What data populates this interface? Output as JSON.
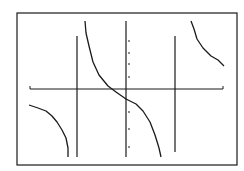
{
  "chart_data": {
    "type": "line",
    "title": "",
    "xlabel": "",
    "ylabel": "",
    "grid": false,
    "legend": null,
    "frame": {
      "x0": 17,
      "y0": 13,
      "x1": 237,
      "y1": 165
    },
    "axes": {
      "x_axis": {
        "y": 89,
        "x_start": 30,
        "x_end": 223
      },
      "y_axis": {
        "x": 126,
        "y_start": 21,
        "y_end": 157
      },
      "y_ticks_pixel": [
        41,
        53,
        64,
        77,
        112,
        129,
        147
      ]
    },
    "asymptotes_pixel_x": [
      77,
      175
    ],
    "series": [
      {
        "name": "left branch",
        "points": [
          [
            29,
            105
          ],
          [
            38,
            108
          ],
          [
            46,
            111
          ],
          [
            52,
            116
          ],
          [
            57,
            122
          ],
          [
            62,
            130
          ],
          [
            66,
            138
          ],
          [
            68,
            148
          ],
          [
            68,
            157
          ]
        ]
      },
      {
        "name": "center branch",
        "points": [
          [
            85,
            21
          ],
          [
            86,
            33
          ],
          [
            89,
            46
          ],
          [
            93,
            62
          ],
          [
            99,
            75
          ],
          [
            108,
            86
          ],
          [
            116,
            92
          ],
          [
            126,
            99
          ],
          [
            136,
            104
          ],
          [
            143,
            111
          ],
          [
            150,
            122
          ],
          [
            155,
            135
          ],
          [
            159,
            148
          ],
          [
            161,
            157
          ]
        ]
      },
      {
        "name": "right branch",
        "points": [
          [
            191,
            21
          ],
          [
            194,
            29
          ],
          [
            197,
            39
          ],
          [
            203,
            48
          ],
          [
            211,
            56
          ],
          [
            218,
            60
          ],
          [
            224,
            66
          ]
        ]
      }
    ],
    "colors": {
      "line": "#1a1a1a",
      "background": "#ffffff"
    }
  }
}
